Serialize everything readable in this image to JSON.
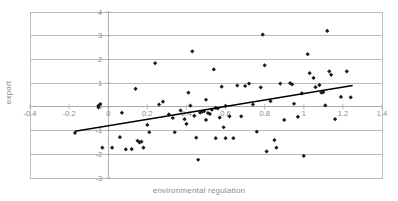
{
  "chart_data": {
    "type": "scatter",
    "title": "",
    "xlabel": "environmental regulation",
    "ylabel": "export",
    "xlim": [
      -0.4,
      1.4
    ],
    "ylim": [
      -3,
      4
    ],
    "xticks": [
      -0.4,
      -0.2,
      0,
      0.2,
      0.4,
      0.6,
      0.8,
      1,
      1.2,
      1.4
    ],
    "xtick_labels": [
      "-0.4",
      "-0.2",
      "0",
      "0.2",
      "0.4",
      "0.6",
      "0.8",
      "1",
      "1.2",
      "1.4"
    ],
    "yticks": [
      -3,
      -2,
      -1,
      0,
      1,
      2,
      3,
      4
    ],
    "ytick_labels": [
      "-3",
      "-2",
      "-1",
      "0",
      "1",
      "2",
      "3",
      "4"
    ],
    "grid": "horizontal",
    "legend": "none",
    "marker": "diamond",
    "marker_color": "#1a1a1a",
    "gridline_color": "#a9a9a9",
    "frame_color": "#b8b8b8",
    "text_color": "#8a8a8a",
    "trendline": {
      "type": "linear",
      "color": "#000000",
      "x_start": -0.17,
      "y_start": -1.03,
      "x_end": 1.25,
      "y_end": 0.9
    },
    "points": [
      {
        "x": -0.17,
        "y": -1.1
      },
      {
        "x": -0.05,
        "y": 0.05
      },
      {
        "x": -0.05,
        "y": -0.02
      },
      {
        "x": -0.04,
        "y": 0.12
      },
      {
        "x": -0.03,
        "y": -1.72
      },
      {
        "x": 0.02,
        "y": -1.72
      },
      {
        "x": 0.06,
        "y": -1.28
      },
      {
        "x": 0.07,
        "y": -0.25
      },
      {
        "x": 0.09,
        "y": -1.79
      },
      {
        "x": 0.12,
        "y": -1.78
      },
      {
        "x": 0.14,
        "y": 0.76
      },
      {
        "x": 0.15,
        "y": -1.43
      },
      {
        "x": 0.16,
        "y": -1.5
      },
      {
        "x": 0.17,
        "y": -1.47
      },
      {
        "x": 0.18,
        "y": -1.72
      },
      {
        "x": 0.2,
        "y": -0.76
      },
      {
        "x": 0.21,
        "y": -1.07
      },
      {
        "x": 0.24,
        "y": 1.84
      },
      {
        "x": 0.26,
        "y": 0.1
      },
      {
        "x": 0.28,
        "y": 0.22
      },
      {
        "x": 0.31,
        "y": -0.32
      },
      {
        "x": 0.33,
        "y": -0.47
      },
      {
        "x": 0.34,
        "y": -1.07
      },
      {
        "x": 0.37,
        "y": -0.15
      },
      {
        "x": 0.39,
        "y": -0.52
      },
      {
        "x": 0.4,
        "y": -0.72
      },
      {
        "x": 0.41,
        "y": 0.6
      },
      {
        "x": 0.42,
        "y": 0.05
      },
      {
        "x": 0.43,
        "y": 2.34
      },
      {
        "x": 0.44,
        "y": -0.38
      },
      {
        "x": 0.45,
        "y": -1.3
      },
      {
        "x": 0.46,
        "y": -2.23
      },
      {
        "x": 0.47,
        "y": -0.24
      },
      {
        "x": 0.48,
        "y": -0.2
      },
      {
        "x": 0.49,
        "y": -0.18
      },
      {
        "x": 0.5,
        "y": 0.3
      },
      {
        "x": 0.5,
        "y": -0.55
      },
      {
        "x": 0.51,
        "y": -0.26
      },
      {
        "x": 0.52,
        "y": -0.3
      },
      {
        "x": 0.53,
        "y": -0.12
      },
      {
        "x": 0.54,
        "y": 1.58
      },
      {
        "x": 0.55,
        "y": -0.04
      },
      {
        "x": 0.55,
        "y": -1.32
      },
      {
        "x": 0.56,
        "y": -0.07
      },
      {
        "x": 0.57,
        "y": -0.45
      },
      {
        "x": 0.58,
        "y": 0.85
      },
      {
        "x": 0.59,
        "y": -0.86
      },
      {
        "x": 0.6,
        "y": 0.04
      },
      {
        "x": 0.6,
        "y": -1.32
      },
      {
        "x": 0.62,
        "y": -0.4
      },
      {
        "x": 0.64,
        "y": -1.32
      },
      {
        "x": 0.66,
        "y": 0.9
      },
      {
        "x": 0.68,
        "y": -0.4
      },
      {
        "x": 0.7,
        "y": 0.88
      },
      {
        "x": 0.72,
        "y": 0.98
      },
      {
        "x": 0.74,
        "y": 0.1
      },
      {
        "x": 0.76,
        "y": -1.05
      },
      {
        "x": 0.78,
        "y": 0.82
      },
      {
        "x": 0.79,
        "y": 3.05
      },
      {
        "x": 0.8,
        "y": 1.75
      },
      {
        "x": 0.81,
        "y": -1.88
      },
      {
        "x": 0.83,
        "y": 0.24
      },
      {
        "x": 0.85,
        "y": -1.4
      },
      {
        "x": 0.86,
        "y": -1.72
      },
      {
        "x": 0.88,
        "y": 0.98
      },
      {
        "x": 0.9,
        "y": -0.55
      },
      {
        "x": 0.93,
        "y": 1.0
      },
      {
        "x": 0.94,
        "y": 0.95
      },
      {
        "x": 0.95,
        "y": 0.13
      },
      {
        "x": 0.97,
        "y": -0.42
      },
      {
        "x": 0.99,
        "y": 0.57
      },
      {
        "x": 1.0,
        "y": -2.07
      },
      {
        "x": 1.02,
        "y": 2.22
      },
      {
        "x": 1.03,
        "y": 1.42
      },
      {
        "x": 1.05,
        "y": 1.22
      },
      {
        "x": 1.06,
        "y": 0.83
      },
      {
        "x": 1.08,
        "y": 0.92
      },
      {
        "x": 1.09,
        "y": 0.6
      },
      {
        "x": 1.1,
        "y": 0.62
      },
      {
        "x": 1.11,
        "y": 0.06
      },
      {
        "x": 1.12,
        "y": 3.2
      },
      {
        "x": 1.13,
        "y": 1.5
      },
      {
        "x": 1.14,
        "y": 1.35
      },
      {
        "x": 1.16,
        "y": -0.52
      },
      {
        "x": 1.19,
        "y": 0.42
      },
      {
        "x": 1.22,
        "y": 1.5
      },
      {
        "x": 1.24,
        "y": 0.4
      }
    ]
  }
}
